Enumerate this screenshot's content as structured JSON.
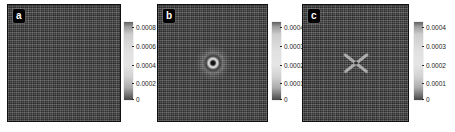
{
  "figure": {
    "panels": [
      {
        "label": "a",
        "ticks": [
          "0.0008",
          "0.0006",
          "0.0004",
          "0.0002",
          "0"
        ],
        "feature": "uniform-noisy-lattice"
      },
      {
        "label": "b",
        "ticks": [
          "0.0004",
          "0.0003",
          "0.0002",
          "0.0001",
          "0"
        ],
        "feature": "central-vortex-dark-core-bright-ring"
      },
      {
        "label": "c",
        "ticks": [
          "0.0004",
          "0.0003",
          "0.0002",
          "0.0001",
          "0"
        ],
        "feature": "central-x-shaped-cross"
      }
    ],
    "colors": {
      "background": "#ffffff",
      "panel_base": "#414141",
      "panel_border": "#101010",
      "label_box": "#000000",
      "label_text": "#ffffff",
      "colorbar_light": "#e5e5e5",
      "colorbar_dark_bottom": "#474747",
      "colorbar_dark_top": "#616161",
      "tick_text": "#1c1c1c"
    }
  },
  "chart_data": [
    {
      "type": "heatmap",
      "panel": "a",
      "colorbar_ticks": [
        0.0008,
        0.0006,
        0.0004,
        0.0002,
        0
      ],
      "colorbar_range": [
        0,
        0.0008
      ],
      "colormap": "grayscale (dark at extremes, light mid)",
      "content": "dense noisy grid/plaid lattice texture, no central defect"
    },
    {
      "type": "heatmap",
      "panel": "b",
      "colorbar_ticks": [
        0.0004,
        0.0003,
        0.0002,
        0.0001,
        0
      ],
      "colorbar_range": [
        0,
        0.0004
      ],
      "colormap": "grayscale (dark at extremes, light mid)",
      "content": "same lattice texture with central point defect: dark core surrounded by bright ring and faint halo"
    },
    {
      "type": "heatmap",
      "panel": "c",
      "colorbar_ticks": [
        0.0004,
        0.0003,
        0.0002,
        0.0001,
        0
      ],
      "colorbar_range": [
        0,
        0.0004
      ],
      "colormap": "grayscale (dark at extremes, light mid)",
      "content": "same lattice texture with central X-shaped bright cross defect"
    }
  ]
}
